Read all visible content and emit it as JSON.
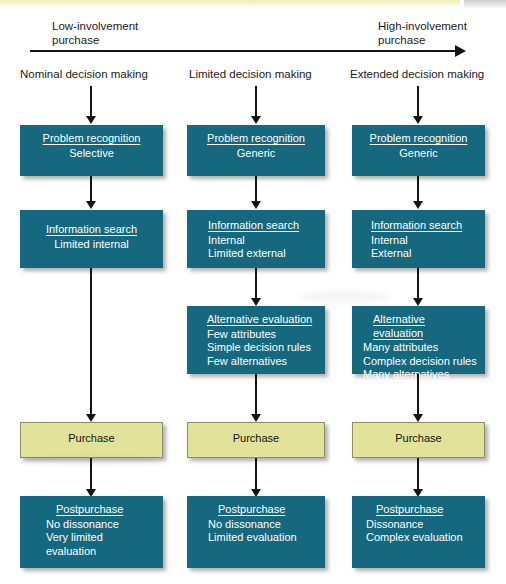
{
  "figure": {
    "axis": {
      "left_label": "Low-involvement\npurchase",
      "right_label": "High-involvement\npurchase"
    },
    "columns": [
      {
        "id": "nominal",
        "label": "Nominal decision making",
        "steps": [
          {
            "id": "problem-recognition",
            "title": "Problem recognition",
            "lines": [
              "Selective"
            ],
            "align": "center",
            "color": "#15687d"
          },
          {
            "id": "information-search",
            "title": "Information search",
            "lines": [
              "Limited internal"
            ],
            "align": "center",
            "color": "#15687d"
          },
          {
            "id": "purchase",
            "title": "",
            "lines": [
              "Purchase"
            ],
            "align": "center",
            "color": "#e2e39b"
          },
          {
            "id": "postpurchase",
            "title": "Postpurchase",
            "lines": [
              "No dissonance",
              "Very limited",
              "evaluation"
            ],
            "align": "left",
            "color": "#15687d"
          }
        ]
      },
      {
        "id": "limited",
        "label": "Limited decision making",
        "steps": [
          {
            "id": "problem-recognition",
            "title": "Problem recognition",
            "lines": [
              "Generic"
            ],
            "align": "center",
            "color": "#15687d"
          },
          {
            "id": "information-search",
            "title": "Information search",
            "lines": [
              "Internal",
              "Limited external"
            ],
            "align": "left",
            "color": "#15687d"
          },
          {
            "id": "alternative-evaluation",
            "title": "Alternative evaluation",
            "lines": [
              "Few attributes",
              "Simple decision rules",
              "Few alternatives"
            ],
            "align": "left",
            "color": "#15687d"
          },
          {
            "id": "purchase",
            "title": "",
            "lines": [
              "Purchase"
            ],
            "align": "center",
            "color": "#e2e39b"
          },
          {
            "id": "postpurchase",
            "title": "Postpurchase",
            "lines": [
              "No dissonance",
              "Limited evaluation"
            ],
            "align": "left",
            "color": "#15687d"
          }
        ]
      },
      {
        "id": "extended",
        "label": "Extended decision making",
        "steps": [
          {
            "id": "problem-recognition",
            "title": "Problem recognition",
            "lines": [
              "Generic"
            ],
            "align": "center",
            "color": "#15687d"
          },
          {
            "id": "information-search",
            "title": "Information search",
            "lines": [
              "Internal",
              "External"
            ],
            "align": "left",
            "color": "#15687d"
          },
          {
            "id": "alternative-evaluation",
            "title": "Alternative evaluation",
            "lines": [
              "Many attributes",
              "Complex decision rules",
              "Many alternatives"
            ],
            "align": "left",
            "color": "#15687d"
          },
          {
            "id": "purchase",
            "title": "",
            "lines": [
              "Purchase"
            ],
            "align": "center",
            "color": "#e2e39b"
          },
          {
            "id": "postpurchase",
            "title": "Postpurchase",
            "lines": [
              "Dissonance",
              "Complex evaluation"
            ],
            "align": "left",
            "color": "#15687d"
          }
        ]
      }
    ]
  }
}
